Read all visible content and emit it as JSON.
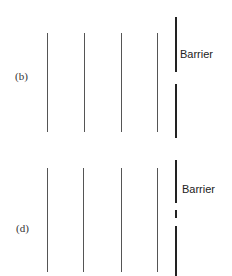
{
  "panels": [
    {
      "id": "b",
      "label": "(b)",
      "barrier_label": "Barrier",
      "wavefront_count": 4,
      "barrier": "single opening"
    },
    {
      "id": "d",
      "label": "(d)",
      "barrier_label": "Barrier",
      "wavefront_count": 4,
      "barrier": "two openings"
    }
  ]
}
